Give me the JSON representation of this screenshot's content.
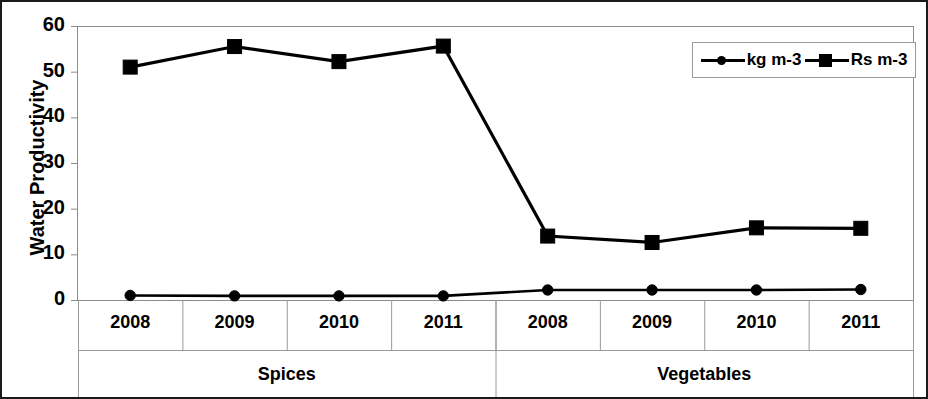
{
  "chart_data": {
    "type": "line",
    "title": "",
    "xlabel": "",
    "ylabel": "Water Productivity",
    "ylim": [
      0,
      60
    ],
    "yticks": [
      0,
      10,
      20,
      30,
      40,
      50,
      60
    ],
    "grid": false,
    "legend_position": "top-right",
    "categories": [
      "2008",
      "2009",
      "2010",
      "2011",
      "2008",
      "2009",
      "2010",
      "2011"
    ],
    "groups": [
      {
        "label": "Spices",
        "categories": [
          "2008",
          "2009",
          "2010",
          "2011"
        ]
      },
      {
        "label": "Vegetables",
        "categories": [
          "2008",
          "2009",
          "2010",
          "2011"
        ]
      }
    ],
    "series": [
      {
        "name": "kg m-3",
        "marker": "circle",
        "color": "#000000",
        "values": [
          1.0,
          0.9,
          0.9,
          0.9,
          2.2,
          2.2,
          2.2,
          2.3
        ]
      },
      {
        "name": "Rs m-3",
        "marker": "square",
        "color": "#000000",
        "values": [
          51.0,
          55.5,
          52.2,
          55.6,
          14.0,
          12.6,
          15.8,
          15.7
        ]
      }
    ]
  },
  "axis": {
    "y_title": "Water Productivity",
    "y_ticks": [
      "60",
      "50",
      "40",
      "30",
      "20",
      "10",
      "0"
    ]
  },
  "legend": {
    "items": [
      {
        "label": "kg m-3",
        "marker": "circle-marker"
      },
      {
        "label": "Rs m-3",
        "marker": "square-marker"
      }
    ]
  },
  "x_axis": {
    "tick_labels": [
      "2008",
      "2009",
      "2010",
      "2011",
      "2008",
      "2009",
      "2010",
      "2011"
    ],
    "group_labels": [
      "Spices",
      "Vegetables"
    ]
  }
}
